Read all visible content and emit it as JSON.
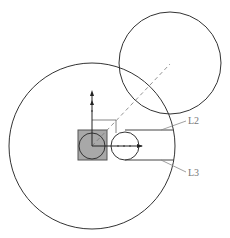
{
  "diagram": {
    "labels": {
      "l2": "L2",
      "l3": "L3"
    },
    "colors": {
      "stroke": "#333333",
      "square_fill": "#a8a8a8",
      "square_stroke": "#555555",
      "leader": "#888888",
      "dashed": "#777777",
      "axis": "#222222"
    }
  }
}
